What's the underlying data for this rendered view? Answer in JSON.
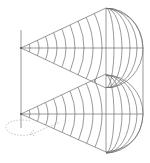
{
  "diagram": {
    "colors": {
      "line": "#6f6f6f",
      "background": "#ffffff",
      "rotation_arrow": "#a0a0a0"
    },
    "sources": [
      {
        "id": "top",
        "x": 21,
        "y": 48
      },
      {
        "id": "bottom",
        "x": 21,
        "y": 114
      }
    ],
    "baseline": {
      "x": 21,
      "y1": 30,
      "y2": 128
    },
    "right_boundary_x": 106,
    "wavefront_count": 11,
    "rotation_indicator": "dashed-elliptical-arrow"
  }
}
